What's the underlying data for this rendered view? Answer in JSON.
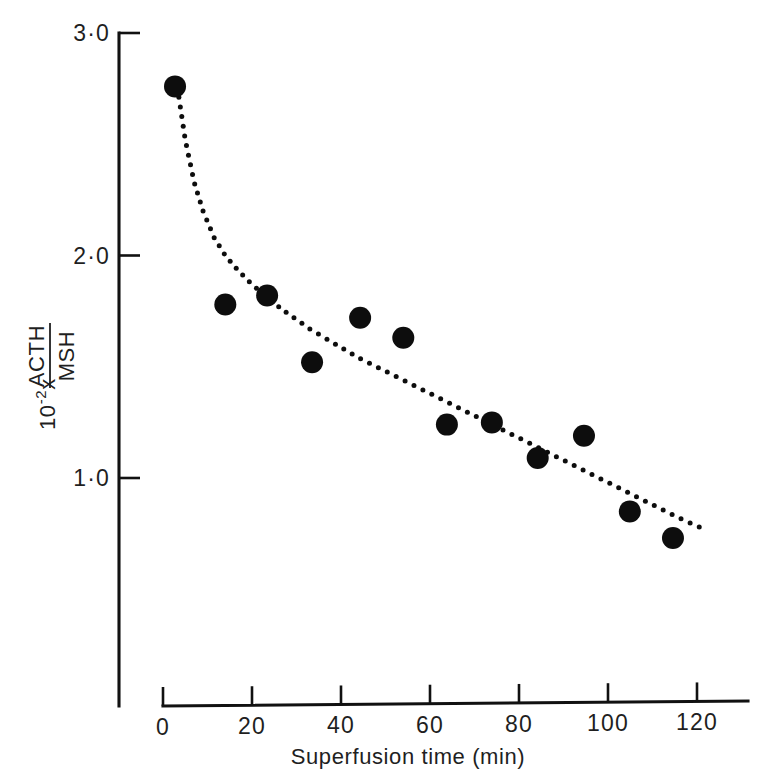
{
  "figure": {
    "title": "",
    "background_color": "#ffffff",
    "ink_color": "#0d0d0d"
  },
  "axes": {
    "y": {
      "label_prefix": "10",
      "label_exponent": "-2",
      "label_times": "x",
      "label_numerator": "ACTH",
      "label_denominator": "MSH",
      "label_full": "10-2 x ACTH/MSH",
      "ticks": [
        {
          "value": 3.0,
          "text": "3·0"
        },
        {
          "value": 2.0,
          "text": "2·0"
        },
        {
          "value": 1.0,
          "text": "1·0"
        }
      ],
      "range": [
        0.55,
        3.0
      ]
    },
    "x": {
      "label": "Superfusion time (min)",
      "ticks": [
        {
          "value": 0,
          "text": "0"
        },
        {
          "value": 20,
          "text": "20"
        },
        {
          "value": 40,
          "text": "40"
        },
        {
          "value": 60,
          "text": "60"
        },
        {
          "value": 80,
          "text": "80"
        },
        {
          "value": 100,
          "text": "100"
        },
        {
          "value": 120,
          "text": "120"
        }
      ],
      "range": [
        0,
        132
      ]
    }
  },
  "chart_data": {
    "type": "scatter",
    "title": "",
    "xlabel": "Superfusion time (min)",
    "ylabel": "10^-2 x ACTH/MSH",
    "xlim": [
      0,
      132
    ],
    "ylim": [
      0.55,
      3.0
    ],
    "grid": false,
    "legend": "none",
    "series": [
      {
        "name": "ACTH/MSH ratio",
        "marker": "filled-circle",
        "color": "#0d0d0d",
        "x": [
          2.7,
          14.0,
          23.4,
          33.5,
          44.3,
          54.0,
          63.8,
          73.9,
          84.2,
          94.6,
          104.9,
          114.6
        ],
        "y": [
          2.76,
          1.78,
          1.82,
          1.52,
          1.72,
          1.63,
          1.24,
          1.25,
          1.09,
          1.19,
          0.85,
          0.73
        ]
      }
    ],
    "fit_curve": {
      "name": "fitted trend (dotted)",
      "style": "dotted",
      "color": "#0d0d0d",
      "x": [
        3.5,
        5.0,
        7.0,
        9.0,
        11.5,
        14.0,
        17.0,
        20.0,
        24.0,
        28.0,
        33.0,
        38.0,
        44.0,
        50.0,
        56.0,
        62.0,
        68.0,
        74.0,
        80.0,
        86.0,
        92.0,
        98.0,
        104.0,
        110.0,
        116.0,
        120.5
      ],
      "y": [
        2.72,
        2.52,
        2.33,
        2.2,
        2.08,
        2.0,
        1.93,
        1.87,
        1.8,
        1.74,
        1.67,
        1.61,
        1.54,
        1.48,
        1.42,
        1.36,
        1.3,
        1.24,
        1.18,
        1.12,
        1.06,
        1.0,
        0.94,
        0.88,
        0.82,
        0.78
      ]
    }
  }
}
